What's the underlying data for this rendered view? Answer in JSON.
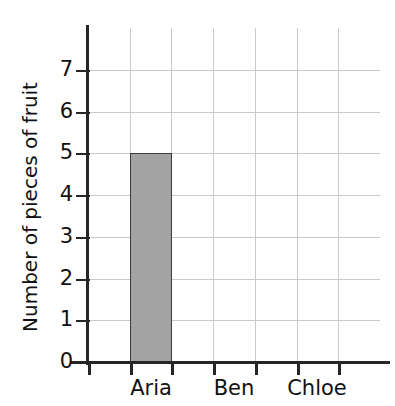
{
  "heading": {
    "text": "name her own bar on the chart below",
    "note": "clipped-top-line"
  },
  "chart_data": {
    "type": "bar",
    "title": "",
    "xlabel": "",
    "ylabel": "Number of pieces of fruit",
    "categories": [
      "Aria",
      "Ben",
      "Chloe"
    ],
    "values": [
      5,
      0,
      0
    ],
    "ylim": [
      0,
      8
    ],
    "ytick_labels": [
      "0",
      "1",
      "2",
      "3",
      "4",
      "5",
      "6",
      "7"
    ],
    "ytick_values": [
      0,
      1,
      2,
      3,
      4,
      5,
      6,
      7
    ],
    "grid": true,
    "legend": "none",
    "bar_color": "#a3a3a3",
    "bar_edge_color": "#3d3d3d",
    "axis_color": "#262626",
    "grid_color": "#c9c9c9",
    "x_tick_count": 7
  }
}
